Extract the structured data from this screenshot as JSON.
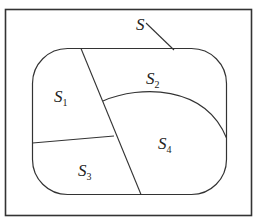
{
  "diagram": {
    "type": "set-partition",
    "universe_label": "S",
    "regions": [
      {
        "name": "S",
        "sub": "1"
      },
      {
        "name": "S",
        "sub": "2"
      },
      {
        "name": "S",
        "sub": "3"
      },
      {
        "name": "S",
        "sub": "4"
      }
    ],
    "colors": {
      "stroke": "#333333",
      "background": "#ffffff"
    }
  }
}
